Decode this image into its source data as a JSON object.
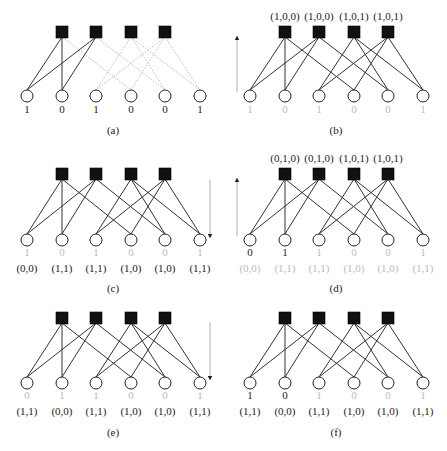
{
  "figure": {
    "colors": {
      "dark": "#222222",
      "light": "#bbbbbb",
      "edge_dark": "#333333",
      "edge_light": "#aaaaaa",
      "check_fill": "#111111",
      "arrow": "#999999"
    },
    "graph": {
      "variable_x_offsets": [
        27,
        62,
        96,
        131,
        165,
        200
      ],
      "check_x_offsets": [
        62,
        96,
        131,
        165
      ],
      "edges": [
        [
          0,
          0
        ],
        [
          0,
          1
        ],
        [
          0,
          3
        ],
        [
          1,
          0
        ],
        [
          1,
          1
        ],
        [
          1,
          4
        ],
        [
          2,
          2
        ],
        [
          2,
          4
        ],
        [
          2,
          5
        ],
        [
          3,
          2
        ],
        [
          3,
          3
        ],
        [
          3,
          5
        ]
      ]
    },
    "panels": [
      {
        "id": "a",
        "label": "(a)",
        "x0": 0,
        "check_y": 32,
        "var_y": 96,
        "value_y": 113,
        "pair_y": null,
        "label_y": 134,
        "check_labels": null,
        "variable_values": [
          "1",
          "0",
          "1",
          "0",
          "0",
          "1"
        ],
        "value_colors": [
          "dark",
          "dark",
          "dark",
          "dark",
          "dark",
          "dark"
        ],
        "pairs": null,
        "pair_colors": null,
        "edge_styles": [
          "solid",
          "solid",
          "dotted",
          "solid",
          "solid",
          "dotted",
          "dotted",
          "dotted",
          "dotted",
          "dotted",
          "dotted",
          "dotted"
        ],
        "arrow": null
      },
      {
        "id": "b",
        "label": "(b)",
        "x0": 223,
        "check_y": 32,
        "var_y": 96,
        "value_y": 113,
        "pair_y": null,
        "label_y": 134,
        "check_labels": [
          "(1,0,0)",
          "(1,0,0)",
          "(1,0,1)",
          "(1,0,1)"
        ],
        "variable_values": [
          "1",
          "0",
          "1",
          "0",
          "0",
          "1"
        ],
        "value_colors": [
          "light",
          "light",
          "light",
          "light",
          "light",
          "light"
        ],
        "pairs": null,
        "pair_colors": null,
        "edge_styles": [
          "solid",
          "solid",
          "solid",
          "solid",
          "solid",
          "solid",
          "solid",
          "solid",
          "solid",
          "solid",
          "solid",
          "solid"
        ],
        "arrow": {
          "direction": "up",
          "x": 237,
          "y_start": 92,
          "y_end": 38
        }
      },
      {
        "id": "c",
        "label": "(c)",
        "x0": 0,
        "check_y": 174,
        "var_y": 240,
        "value_y": 256,
        "pair_y": 272,
        "label_y": 292,
        "check_labels": null,
        "variable_values": [
          "1",
          "0",
          "1",
          "0",
          "0",
          "1"
        ],
        "value_colors": [
          "light",
          "light",
          "light",
          "light",
          "light",
          "light"
        ],
        "pairs": [
          "(0,0)",
          "(1,1)",
          "(1,1)",
          "(1,0)",
          "(1,0)",
          "(1,1)"
        ],
        "pair_colors": [
          "dark",
          "dark",
          "dark",
          "dark",
          "dark",
          "dark"
        ],
        "edge_styles": [
          "solid",
          "solid",
          "solid",
          "solid",
          "solid",
          "solid",
          "solid",
          "solid",
          "solid",
          "solid",
          "solid",
          "solid"
        ],
        "arrow": {
          "direction": "down",
          "x": 210,
          "y_start": 180,
          "y_end": 236
        }
      },
      {
        "id": "d",
        "label": "(d)",
        "x0": 223,
        "check_y": 174,
        "var_y": 240,
        "value_y": 256,
        "pair_y": 272,
        "label_y": 292,
        "check_labels": [
          "(0,1,0)",
          "(0,1,0)",
          "(1,0,1)",
          "(1,0,1)"
        ],
        "variable_values": [
          "0",
          "1",
          "1",
          "0",
          "0",
          "1"
        ],
        "value_colors": [
          "dark",
          "dark",
          "light",
          "light",
          "light",
          "light"
        ],
        "pairs": [
          "(0,0)",
          "(1,1)",
          "(1,1)",
          "(1,0)",
          "(1,0)",
          "(1,1)"
        ],
        "pair_colors": [
          "light",
          "light",
          "light",
          "light",
          "light",
          "light"
        ],
        "edge_styles": [
          "solid",
          "solid",
          "solid",
          "solid",
          "solid",
          "solid",
          "solid",
          "solid",
          "solid",
          "solid",
          "solid",
          "solid"
        ],
        "arrow": {
          "direction": "up",
          "x": 237,
          "y_start": 236,
          "y_end": 180
        }
      },
      {
        "id": "e",
        "label": "(e)",
        "x0": 0,
        "check_y": 318,
        "var_y": 383,
        "value_y": 399,
        "pair_y": 415,
        "label_y": 436,
        "check_labels": null,
        "variable_values": [
          "0",
          "1",
          "1",
          "0",
          "0",
          "1"
        ],
        "value_colors": [
          "light",
          "light",
          "light",
          "light",
          "light",
          "light"
        ],
        "pairs": [
          "(1,1)",
          "(0,0)",
          "(1,1)",
          "(1,0)",
          "(1,0)",
          "(1,1)"
        ],
        "pair_colors": [
          "dark",
          "dark",
          "dark",
          "dark",
          "dark",
          "dark"
        ],
        "edge_styles": [
          "solid",
          "solid",
          "solid",
          "solid",
          "solid",
          "solid",
          "solid",
          "solid",
          "solid",
          "solid",
          "solid",
          "solid"
        ],
        "arrow": {
          "direction": "down",
          "x": 210,
          "y_start": 322,
          "y_end": 378
        }
      },
      {
        "id": "f",
        "label": "(f)",
        "x0": 223,
        "check_y": 318,
        "var_y": 383,
        "value_y": 399,
        "pair_y": 415,
        "label_y": 436,
        "check_labels": null,
        "variable_values": [
          "1",
          "0",
          "1",
          "0",
          "0",
          "1"
        ],
        "value_colors": [
          "dark",
          "dark",
          "light",
          "light",
          "light",
          "light"
        ],
        "pairs": [
          "(1,1)",
          "(0,0)",
          "(1,1)",
          "(1,0)",
          "(1,0)",
          "(1,1)"
        ],
        "pair_colors": [
          "dark",
          "dark",
          "dark",
          "dark",
          "dark",
          "dark"
        ],
        "edge_styles": [
          "solid",
          "solid",
          "solid",
          "solid",
          "solid",
          "solid",
          "solid",
          "solid",
          "solid",
          "solid",
          "solid",
          "solid"
        ],
        "arrow": null
      }
    ],
    "caption_fragment": ""
  }
}
